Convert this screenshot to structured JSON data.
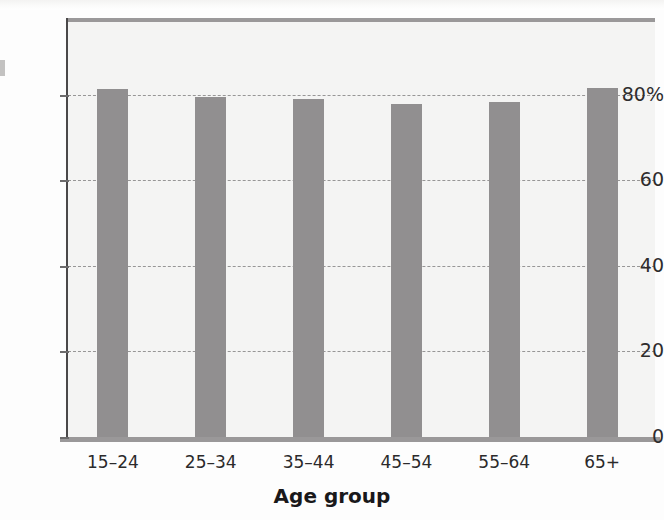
{
  "chart_data": {
    "type": "bar",
    "title": "",
    "subtitle": "",
    "xlabel": "Age group",
    "ylabel": "",
    "categories": [
      "15–24",
      "25–34",
      "35–44",
      "45–54",
      "55–64",
      "65+"
    ],
    "values": [
      81.5,
      79.5,
      79,
      78,
      78.3,
      81.7
    ],
    "series": [
      {
        "name": "",
        "values": [
          81.5,
          79.5,
          79,
          78,
          78.3,
          81.7
        ]
      }
    ],
    "ylim": [
      0,
      98
    ],
    "yticks": [
      0,
      20,
      40,
      60,
      80
    ],
    "ytick_labels": [
      "0",
      "20",
      "40",
      "60",
      "80%"
    ],
    "grid": "horizontal-dashed",
    "legend": "none",
    "bar_color": "#918f90",
    "plot_background": "#f4f4f3",
    "axis_color": "#4a4849",
    "gridline_color": "#8e8c8d",
    "text_color": "#2b2a2b"
  },
  "axes": {
    "x_title": "Age group"
  }
}
